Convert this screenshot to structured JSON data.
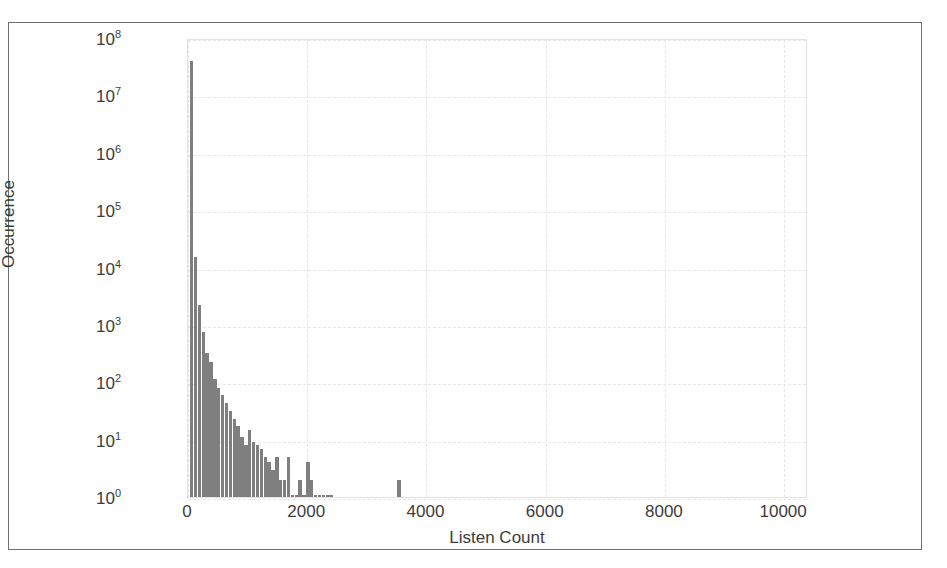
{
  "figure": {
    "frame_color": "#6f6f6f",
    "background": "#ffffff"
  },
  "chart_data": {
    "type": "bar",
    "title": "",
    "subtitle": "",
    "xlabel": "Listen Count",
    "ylabel": "Occurrence",
    "xlim": [
      0,
      10400
    ],
    "ylim": [
      1,
      100000000
    ],
    "yscale": "log",
    "xscale": "linear",
    "grid": true,
    "legend": null,
    "bar_color": "#7f7f7f",
    "bin_width": 65,
    "xticks": [
      0,
      2000,
      4000,
      6000,
      8000,
      10000
    ],
    "xtick_labels": [
      "0",
      "2000",
      "4000",
      "6000",
      "8000",
      "10000"
    ],
    "yticks": [
      1,
      10,
      100,
      1000,
      10000,
      100000,
      1000000,
      10000000,
      100000000
    ],
    "ytick_labels": [
      "10^0",
      "10^1",
      "10^2",
      "10^3",
      "10^4",
      "10^5",
      "10^6",
      "10^7",
      "10^8"
    ],
    "ytick_mantissa": [
      "10",
      "10",
      "10",
      "10",
      "10",
      "10",
      "10",
      "10",
      "10"
    ],
    "ytick_exponent": [
      "0",
      "1",
      "2",
      "3",
      "4",
      "5",
      "6",
      "7",
      "8"
    ],
    "x": [
      33,
      98,
      163,
      228,
      293,
      358,
      423,
      488,
      553,
      618,
      683,
      748,
      813,
      878,
      943,
      1008,
      1073,
      1138,
      1203,
      1268,
      1333,
      1398,
      1463,
      1528,
      1593,
      1658,
      1723,
      1788,
      1853,
      1918,
      1983,
      2048,
      2113,
      2178,
      2243,
      2308,
      2373,
      3510
    ],
    "values": [
      40000000,
      15000,
      2200,
      750,
      330,
      230,
      115,
      80,
      60,
      44,
      32,
      23,
      17,
      11,
      8,
      15,
      9,
      8,
      7,
      5,
      4,
      3,
      5,
      2,
      2,
      5,
      1,
      1,
      2,
      1,
      4,
      2,
      1,
      1,
      1,
      1,
      1,
      2
    ]
  }
}
